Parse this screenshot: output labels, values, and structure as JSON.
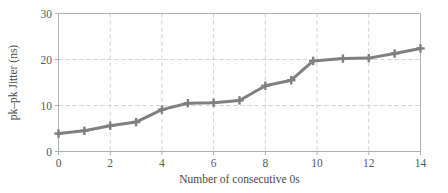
{
  "chart_data": {
    "type": "line",
    "title": "",
    "xlabel": "Number of consecutive 0s",
    "ylabel": "pk–pk Jitter (ns)",
    "x": [
      0,
      1,
      2,
      3,
      4,
      5,
      6,
      7,
      8,
      9,
      9.85,
      11,
      12,
      13,
      14
    ],
    "values": [
      3.9,
      4.5,
      5.6,
      6.4,
      9.1,
      10.5,
      10.6,
      11.1,
      14.3,
      15.5,
      19.7,
      20.2,
      20.3,
      21.3,
      22.4
    ],
    "series": [
      {
        "name": "pk-pk Jitter",
        "values": [
          3.9,
          4.5,
          5.6,
          6.4,
          9.1,
          10.5,
          10.6,
          11.1,
          14.3,
          15.5,
          19.7,
          20.2,
          20.3,
          21.3,
          22.4
        ]
      }
    ],
    "xlim": [
      0,
      14
    ],
    "ylim": [
      0,
      30
    ],
    "xticks": [
      0,
      2,
      4,
      6,
      8,
      10,
      12,
      14
    ],
    "yticks": [
      0,
      10,
      20,
      30
    ],
    "xtick_labels": [
      "0",
      "2",
      "4",
      "6",
      "8",
      "10",
      "12",
      "14"
    ],
    "ytick_labels": [
      "0",
      "10",
      "20",
      "30"
    ],
    "grid": true,
    "grid_style": "dashed",
    "legend": null,
    "marker": "plus",
    "line_color": "#808080",
    "marker_color": "#808080",
    "grid_color": "#cccccc",
    "axis_color": "#b0b0b0",
    "text_color": "#4a4a4a",
    "background": "#ffffff"
  }
}
